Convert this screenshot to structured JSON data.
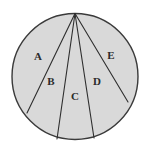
{
  "figure": {
    "canvas": {
      "width": 143,
      "height": 151,
      "background": "#ffffff"
    },
    "style": {
      "fill_color": "#d9d9d9",
      "outline_color": "#3a3a3a",
      "chord_color": "#2e2e2e",
      "label_color": "#2b2b2b",
      "outline_width": 1.4,
      "chord_width": 1.1
    },
    "circle": {
      "cx": 75,
      "cy": 76.5,
      "r": 63
    },
    "apex": {
      "x": 75,
      "y": 13.5,
      "name": "common-vertex"
    },
    "chords": [
      {
        "name": "chord-a-b",
        "x1": 75,
        "y1": 13.5,
        "x2": 27,
        "y2": 113
      },
      {
        "name": "chord-b-c",
        "x1": 75,
        "y1": 13.5,
        "x2": 57,
        "y2": 139
      },
      {
        "name": "chord-c-d",
        "x1": 75,
        "y1": 13.5,
        "x2": 94,
        "y2": 138
      },
      {
        "name": "chord-d-e",
        "x1": 75,
        "y1": 13.5,
        "x2": 128,
        "y2": 102
      }
    ],
    "regions": [
      {
        "id": "A",
        "label": "A",
        "label_x": 38,
        "label_y": 57
      },
      {
        "id": "B",
        "label": "B",
        "label_x": 51,
        "label_y": 82
      },
      {
        "id": "C",
        "label": "C",
        "label_x": 75,
        "label_y": 97
      },
      {
        "id": "D",
        "label": "D",
        "label_x": 97,
        "label_y": 82
      },
      {
        "id": "E",
        "label": "E",
        "label_x": 111,
        "label_y": 56
      }
    ]
  }
}
